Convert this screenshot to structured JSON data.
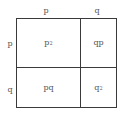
{
  "diagram": {
    "type": "punnett-square",
    "column_headers": [
      "p",
      "q"
    ],
    "row_headers": [
      "p",
      "q"
    ],
    "cells": [
      [
        {
          "base": "p",
          "exp": "2"
        },
        {
          "base": "qp",
          "exp": ""
        }
      ],
      [
        {
          "base": "pq",
          "exp": ""
        },
        {
          "base": "q",
          "exp": "2"
        }
      ]
    ],
    "colors": {
      "line": "#3a3a3a",
      "text": "#555555",
      "background": "#ffffff"
    }
  }
}
